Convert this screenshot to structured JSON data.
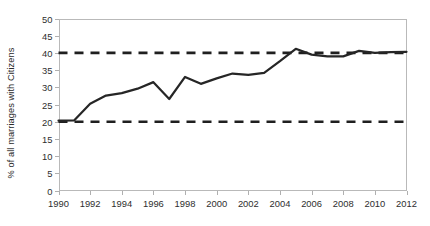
{
  "chart_data": {
    "type": "line",
    "title": "",
    "xlabel": "",
    "ylabel": "% of all marriages with Citizens",
    "xlim": [
      1990,
      2012
    ],
    "ylim": [
      0,
      50
    ],
    "ytick_step": 5,
    "xtick_step": 2,
    "grid": false,
    "legend": "none",
    "x": [
      1990,
      1991,
      1992,
      1993,
      1994,
      1995,
      1996,
      1997,
      1998,
      1999,
      2000,
      2001,
      2002,
      2003,
      2004,
      2005,
      2006,
      2007,
      2008,
      2009,
      2010,
      2011,
      2012
    ],
    "xticks": [
      "1990",
      "1992",
      "1994",
      "1996",
      "1998",
      "2000",
      "2002",
      "2004",
      "2006",
      "2008",
      "2010",
      "2012"
    ],
    "yticks": [
      "0",
      "5",
      "10",
      "15",
      "20",
      "25",
      "30",
      "35",
      "40",
      "45",
      "50"
    ],
    "series": [
      {
        "name": "% of all marriages with Citizens",
        "style": "solid",
        "color": "#262626",
        "values": [
          20.3,
          20.4,
          25.2,
          27.6,
          28.3,
          29.6,
          31.5,
          26.6,
          33.0,
          31.0,
          32.6,
          34.0,
          33.6,
          34.2,
          37.6,
          41.2,
          39.5,
          39.0,
          39.0,
          40.6,
          40.0,
          40.2,
          40.3
        ]
      }
    ],
    "reference_lines": [
      {
        "name": "upper-threshold",
        "value": 40,
        "style": "dashed",
        "color": "#1f1f1f"
      },
      {
        "name": "lower-threshold",
        "value": 20,
        "style": "dashed",
        "color": "#1f1f1f"
      }
    ]
  }
}
